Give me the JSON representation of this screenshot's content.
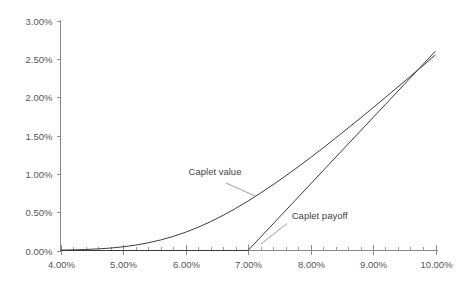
{
  "chart_data": {
    "type": "line",
    "title": "",
    "subtitle": "",
    "xlabel": "",
    "ylabel": "",
    "xlim": [
      4.0,
      10.0
    ],
    "ylim": [
      0.0,
      3.0
    ],
    "grid": false,
    "legend_position": "inline-annotations",
    "x_tick_labels": [
      "4.00%",
      "5.00%",
      "6.00%",
      "7.00%",
      "8.00%",
      "9.00%",
      "10.00%"
    ],
    "x_tick_values": [
      4.0,
      5.0,
      6.0,
      7.0,
      8.0,
      9.0,
      10.0
    ],
    "x_minor_step": 0.2,
    "y_tick_labels": [
      "0.00%",
      "0.50%",
      "1.00%",
      "1.50%",
      "2.00%",
      "2.50%",
      "3.00%"
    ],
    "y_tick_values": [
      0.0,
      0.5,
      1.0,
      1.5,
      2.0,
      2.5,
      3.0
    ],
    "strike": 7.0,
    "series": [
      {
        "name": "Caplet value",
        "label": "Caplet value",
        "color": "#3c3c3c",
        "x": [
          4.0,
          4.2,
          4.4,
          4.6,
          4.8,
          5.0,
          5.2,
          5.4,
          5.6,
          5.8,
          6.0,
          6.2,
          6.4,
          6.6,
          6.8,
          7.0,
          7.2,
          7.4,
          7.6,
          7.8,
          8.0,
          8.2,
          8.4,
          8.6,
          8.8,
          9.0,
          9.2,
          9.4,
          9.6,
          9.8,
          10.0
        ],
        "values": [
          0.005,
          0.008,
          0.013,
          0.021,
          0.032,
          0.048,
          0.07,
          0.1,
          0.137,
          0.183,
          0.238,
          0.302,
          0.376,
          0.458,
          0.548,
          0.645,
          0.749,
          0.858,
          0.972,
          1.09,
          1.212,
          1.337,
          1.465,
          1.596,
          1.728,
          1.862,
          1.998,
          2.135,
          2.273,
          2.412,
          2.552
        ]
      },
      {
        "name": "Caplet payoff",
        "label": "Caplet payoff",
        "color": "#3c3c3c",
        "x": [
          4.0,
          7.0,
          10.0
        ],
        "values": [
          0.0,
          0.0,
          2.6
        ]
      }
    ],
    "annotations": [
      {
        "text": "Caplet value",
        "text_x": 6.05,
        "text_y": 0.98,
        "leader_from_x": 6.65,
        "leader_from_y": 0.88,
        "leader_to_x": 7.13,
        "leader_to_y": 0.705
      },
      {
        "text": "Caplet payoff",
        "text_x": 7.7,
        "text_y": 0.41,
        "leader_from_x": 7.62,
        "leader_from_y": 0.35,
        "leader_to_x": 7.2,
        "leader_to_y": 0.08
      }
    ]
  },
  "colors": {
    "background": "#ffffff",
    "axis": "#8a8a8a",
    "series": "#3c3c3c",
    "tick_text": "#555555",
    "annotation_text": "#444444",
    "leader": "#9e9e9e"
  }
}
